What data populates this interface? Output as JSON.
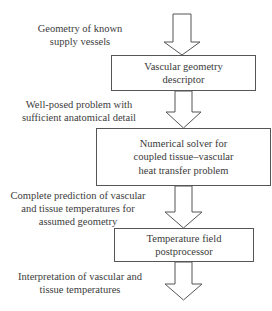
{
  "diagram": {
    "type": "flowchart",
    "direction": "top-to-bottom",
    "colors": {
      "stroke": "#555555",
      "text": "#3a3a3a",
      "background": "#ffffff"
    },
    "inputs": [
      {
        "line1": "Geometry of known",
        "line2": "supply vessels"
      },
      {
        "line1": "Well-posed problem with",
        "line2": "sufficient anatomical detail"
      },
      {
        "line1": "Complete prediction of vascular",
        "line2": "and tissue temperatures for",
        "line3": "assumed geometry"
      },
      {
        "line1": "Interpretation of vascular and",
        "line2": "tissue temperatures"
      }
    ],
    "boxes": [
      {
        "line1": "Vascular geometry",
        "line2": "descriptor"
      },
      {
        "line1": "Numerical solver for",
        "line2": "coupled tissue–vascular",
        "line3": "heat transfer problem"
      },
      {
        "line1": "Temperature field",
        "line2": "postprocessor"
      }
    ]
  }
}
